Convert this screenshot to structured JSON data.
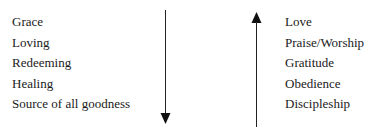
{
  "diagram": {
    "left": {
      "items": [
        "Grace",
        "Loving",
        "Redeeming",
        "Healing",
        "Source of all goodness"
      ],
      "arrow_direction": "down",
      "arrow_icon": "arrow-down-icon"
    },
    "right": {
      "items": [
        "Love",
        "Praise/Worship",
        "Gratitude",
        "Obedience",
        "Discipleship"
      ],
      "arrow_direction": "up",
      "arrow_icon": "arrow-up-icon"
    },
    "colors": {
      "text": "#1a1a1a",
      "arrow": "#222222",
      "background": "#ffffff"
    }
  }
}
